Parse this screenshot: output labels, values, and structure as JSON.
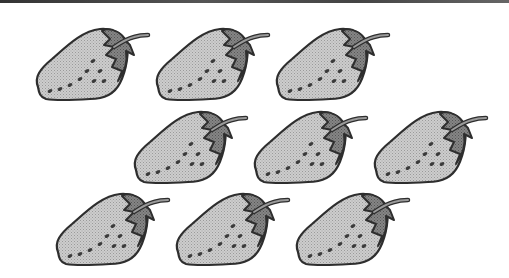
{
  "scene": {
    "description": "Grayscale clip-art illustration of strawberries arranged in three staggered rows",
    "total_count": 9,
    "rows": [
      {
        "row": 1,
        "count": 3,
        "positions": [
          [
            30,
            25
          ],
          [
            150,
            25
          ],
          [
            270,
            25
          ]
        ]
      },
      {
        "row": 2,
        "count": 3,
        "positions": [
          [
            128,
            108
          ],
          [
            248,
            108
          ],
          [
            368,
            108
          ]
        ]
      },
      {
        "row": 3,
        "count": 3,
        "positions": [
          [
            50,
            190
          ],
          [
            170,
            190
          ],
          [
            290,
            190
          ]
        ]
      }
    ]
  },
  "colors": {
    "background": "#ffffff",
    "berry_fill": "#c6c6c6",
    "calyx_fill": "#7c7c7c",
    "outline": "#2e2e2e",
    "seeds": "#3a3a3a",
    "top_bar": "#444444"
  }
}
